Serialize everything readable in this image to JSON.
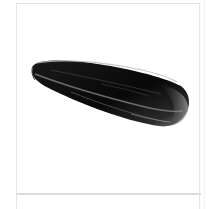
{
  "product_card": {
    "image_alt": "Sunflower seed",
    "image_subject": "black sunflower seed with light grey stripes",
    "colors": {
      "card_border": "#e4e4e4",
      "divider": "#dcdcdc",
      "background": "#ffffff",
      "seed_dark": "#0d0d0d",
      "seed_stripe": "#8a8a8a"
    }
  }
}
